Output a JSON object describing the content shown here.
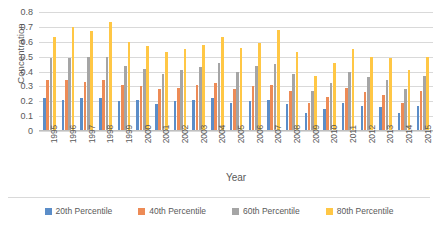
{
  "chart_data": {
    "type": "bar",
    "title": "",
    "xlabel": "Year",
    "ylabel": "Concentration",
    "ylim": [
      0,
      0.8
    ],
    "ytick_labels": [
      "0.8",
      "0.7",
      "0.6",
      "0.5",
      "0.4",
      "0.3",
      "0.2",
      "0.1",
      "0"
    ],
    "ytick_values": [
      0.8,
      0.7,
      0.6,
      0.5,
      0.4,
      0.3,
      0.2,
      0.1,
      0
    ],
    "grid": true,
    "legend_position": "bottom",
    "categories": [
      "1995",
      "1996",
      "1997",
      "1998",
      "1999",
      "2000",
      "2001",
      "2002",
      "2003",
      "2004",
      "2005",
      "2006",
      "2007",
      "2008",
      "2009",
      "2010",
      "2011",
      "2012",
      "2013",
      "2014",
      "2015"
    ],
    "series": [
      {
        "name": "20th Percentile",
        "color": "#5b8dc8",
        "values": [
          0.22,
          0.21,
          0.22,
          0.22,
          0.2,
          0.21,
          0.18,
          0.2,
          0.21,
          0.22,
          0.19,
          0.2,
          0.21,
          0.18,
          0.12,
          0.15,
          0.19,
          0.17,
          0.16,
          0.12,
          0.17
        ]
      },
      {
        "name": "40th Percentile",
        "color": "#ed8b56",
        "values": [
          0.34,
          0.34,
          0.33,
          0.34,
          0.31,
          0.3,
          0.28,
          0.29,
          0.31,
          0.32,
          0.28,
          0.3,
          0.31,
          0.27,
          0.19,
          0.23,
          0.29,
          0.26,
          0.24,
          0.19,
          0.27
        ]
      },
      {
        "name": "60th Percentile",
        "color": "#a5a5a5",
        "values": [
          0.49,
          0.49,
          0.5,
          0.5,
          0.44,
          0.42,
          0.38,
          0.41,
          0.43,
          0.46,
          0.4,
          0.44,
          0.45,
          0.38,
          0.27,
          0.32,
          0.4,
          0.36,
          0.34,
          0.28,
          0.37
        ]
      },
      {
        "name": "80th Percentile",
        "color": "#ffc745",
        "values": [
          0.63,
          0.7,
          0.67,
          0.73,
          0.6,
          0.57,
          0.53,
          0.55,
          0.58,
          0.63,
          0.56,
          0.59,
          0.68,
          0.53,
          0.37,
          0.46,
          0.55,
          0.5,
          0.49,
          0.41,
          0.5
        ]
      }
    ]
  },
  "legend": {
    "items": [
      {
        "label": "20th Percentile",
        "color": "#5b8dc8"
      },
      {
        "label": "40th Percentile",
        "color": "#ed8b56"
      },
      {
        "label": "60th Percentile",
        "color": "#a5a5a5"
      },
      {
        "label": "80th Percentile",
        "color": "#ffc745"
      }
    ]
  }
}
